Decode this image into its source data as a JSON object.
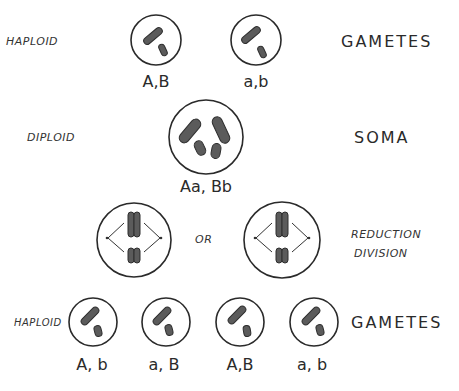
{
  "rows": {
    "parent_gametes": {
      "left_label": "HAPLOID",
      "right_label": "GAMETES",
      "cells": [
        {
          "genotype": "A,B",
          "chromosomes": [
            "long",
            "short"
          ]
        },
        {
          "genotype": "a,b",
          "chromosomes": [
            "long",
            "short"
          ]
        }
      ]
    },
    "soma": {
      "left_label": "DIPLOID",
      "right_label": "SOMA",
      "cells": [
        {
          "genotype": "Aa, Bb",
          "chromosomes": [
            "long",
            "long",
            "short",
            "short"
          ]
        }
      ]
    },
    "division": {
      "connector_label": "OR",
      "right_label_line1": "REDUCTION",
      "right_label_line2": "DIVISION",
      "cells": [
        {
          "arrangement": "alignment-1"
        },
        {
          "arrangement": "alignment-2"
        }
      ]
    },
    "offspring_gametes": {
      "left_label": "HAPLOID",
      "right_label": "GAMETES",
      "cells": [
        {
          "genotype": "A, b"
        },
        {
          "genotype": "a, B"
        },
        {
          "genotype": "A,B"
        },
        {
          "genotype": "a, b"
        }
      ]
    }
  },
  "colors": {
    "ink": "#2a2a2a",
    "chromosome_fill": "#5b5b5b",
    "background": "#ffffff"
  }
}
